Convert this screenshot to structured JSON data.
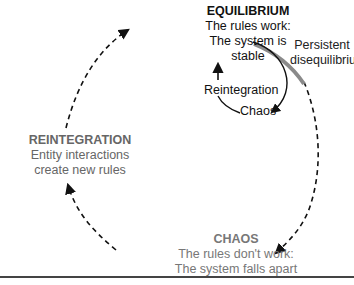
{
  "diagram": {
    "type": "cycle",
    "nodes": {
      "equilibrium": {
        "title": "EQUILIBRIUM",
        "line1": "The rules work:",
        "line2": "The system is",
        "line3": "stable"
      },
      "reintegration": {
        "title": "REINTEGRATION",
        "line1": "Entity interactions",
        "line2": "create new rules"
      },
      "chaos": {
        "title": "CHAOS",
        "line1": "The rules don't work:",
        "line2": "The system falls apart"
      }
    },
    "inner_loop": {
      "reintegration_label": "Reintegration",
      "chaos_label": "Chaos"
    },
    "persistent_label": {
      "line1": "Persistent",
      "line2": "disequilibrium"
    },
    "edges": [
      {
        "from": "EQUILIBRIUM",
        "to": "CHAOS",
        "style": "dashed"
      },
      {
        "from": "CHAOS",
        "to": "REINTEGRATION",
        "style": "dashed"
      },
      {
        "from": "REINTEGRATION",
        "to": "EQUILIBRIUM",
        "style": "dashed"
      },
      {
        "from": "EQUILIBRIUM",
        "to": "Chaos",
        "style": "solid"
      },
      {
        "from": "Chaos",
        "to": "EQUILIBRIUM",
        "via": "Reintegration",
        "style": "solid"
      }
    ],
    "colors": {
      "equilibrium_text": "#111111",
      "reintegration_text": "#666666",
      "chaos_text": "#777777",
      "persistent_band": "#8a8a8a",
      "arrows": "#111111"
    }
  }
}
